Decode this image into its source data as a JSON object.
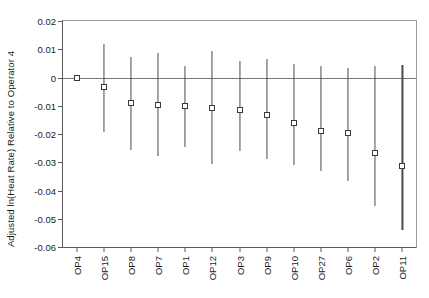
{
  "chart_data": {
    "type": "scatter",
    "title": "",
    "xlabel": "",
    "ylabel": "Adjusted ln(Heat Rate) Relative to Operator 4",
    "ylim": [
      -0.06,
      0.02
    ],
    "yticks": [
      0.02,
      0.01,
      0,
      -0.01,
      -0.02,
      -0.03,
      -0.04,
      -0.05,
      -0.06
    ],
    "ytick_labels": [
      "0.02",
      "0.01",
      "0",
      "-0.01",
      "-0.02",
      "-0.03",
      "-0.04",
      "-0.05",
      "-0.06"
    ],
    "grid": false,
    "legend": "none",
    "reference_line": 0,
    "categories": [
      "OP4",
      "OP15",
      "OP8",
      "OP7",
      "OP1",
      "OP12",
      "OP3",
      "OP9",
      "OP10",
      "OP27",
      "OP6",
      "OP2",
      "OP11"
    ],
    "values": [
      0.0,
      -0.0033,
      -0.0091,
      -0.0096,
      -0.0102,
      -0.0107,
      -0.0116,
      -0.0133,
      -0.0161,
      -0.0189,
      -0.0195,
      -0.0268,
      -0.0312
    ],
    "ci_upper": [
      0.0,
      0.0118,
      0.0074,
      0.0088,
      0.004,
      0.0095,
      0.006,
      0.0067,
      0.0049,
      0.004,
      0.0035,
      0.0042,
      0.0046
    ],
    "ci_lower": [
      0.0,
      -0.0193,
      -0.0256,
      -0.0277,
      -0.0246,
      -0.0305,
      -0.026,
      -0.0288,
      -0.031,
      -0.033,
      -0.0365,
      -0.0456,
      -0.054
    ],
    "points": [
      {
        "label": "OP4",
        "value": 0.0,
        "ci_upper": 0.0,
        "ci_lower": 0.0
      },
      {
        "label": "OP15",
        "value": -0.0033,
        "ci_upper": 0.0118,
        "ci_lower": -0.0193
      },
      {
        "label": "OP8",
        "value": -0.0091,
        "ci_upper": 0.0074,
        "ci_lower": -0.0256
      },
      {
        "label": "OP7",
        "value": -0.0096,
        "ci_upper": 0.0088,
        "ci_lower": -0.0277
      },
      {
        "label": "OP1",
        "value": -0.0102,
        "ci_upper": 0.004,
        "ci_lower": -0.0246
      },
      {
        "label": "OP12",
        "value": -0.0107,
        "ci_upper": 0.0095,
        "ci_lower": -0.0305
      },
      {
        "label": "OP3",
        "value": -0.0116,
        "ci_upper": 0.006,
        "ci_lower": -0.026
      },
      {
        "label": "OP9",
        "value": -0.0133,
        "ci_upper": 0.0067,
        "ci_lower": -0.0288
      },
      {
        "label": "OP10",
        "value": -0.0161,
        "ci_upper": 0.0049,
        "ci_lower": -0.031
      },
      {
        "label": "OP27",
        "value": -0.0189,
        "ci_upper": 0.004,
        "ci_lower": -0.033
      },
      {
        "label": "OP6",
        "value": -0.0195,
        "ci_upper": 0.0035,
        "ci_lower": -0.0365
      },
      {
        "label": "OP2",
        "value": -0.0268,
        "ci_upper": 0.0042,
        "ci_lower": -0.0456
      },
      {
        "label": "OP11",
        "value": -0.0312,
        "ci_upper": 0.0046,
        "ci_lower": -0.054
      }
    ]
  },
  "colors": {
    "marker_edge": "#3a3a3a",
    "marker_face": "#ffffff",
    "error_bar": "#4a4a4a",
    "axis": "#5a5a5a",
    "zero_line": "#777777",
    "text": "#1a1a1a",
    "background": "#ffffff"
  }
}
